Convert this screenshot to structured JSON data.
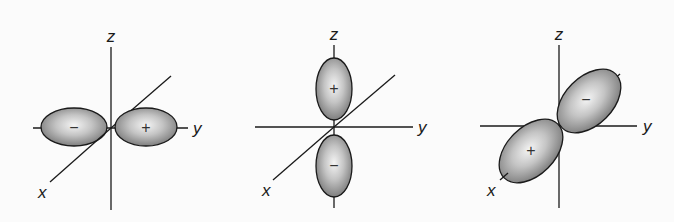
{
  "diagram": {
    "type": "orbital-illustration",
    "colors": {
      "lobe_light": "#f0f0f0",
      "lobe_dark": "#7a7a7a",
      "outline": "#1a1a1a",
      "background": "#fbfbfb"
    },
    "panels": [
      {
        "name": "p-orbital-along-y",
        "axis_labels": {
          "x": "x",
          "y": "y",
          "z": "z"
        },
        "lobes": [
          {
            "position": "negative-y",
            "sign": "−"
          },
          {
            "position": "positive-y",
            "sign": "+"
          }
        ]
      },
      {
        "name": "p-orbital-along-z",
        "axis_labels": {
          "x": "x",
          "y": "y",
          "z": "z"
        },
        "lobes": [
          {
            "position": "positive-z",
            "sign": "+"
          },
          {
            "position": "negative-z",
            "sign": "−"
          }
        ]
      },
      {
        "name": "p-orbital-along-x",
        "axis_labels": {
          "x": "x",
          "y": "y",
          "z": "z"
        },
        "lobes": [
          {
            "position": "negative-x",
            "sign": "−"
          },
          {
            "position": "positive-x",
            "sign": "+"
          }
        ]
      }
    ]
  }
}
